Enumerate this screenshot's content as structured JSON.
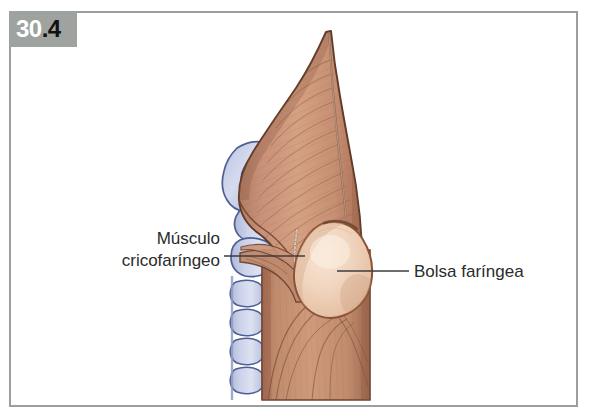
{
  "figure": {
    "number_major": "30",
    "number_minor": ".4",
    "full_number": "30.4",
    "caption_language": "es"
  },
  "frame": {
    "border_color": "#9a9e9c",
    "background_color": "#ffffff",
    "badge_background": "#9ea3a0",
    "badge_major_color": "#ffffff",
    "badge_minor_color": "#111111"
  },
  "annotations": [
    {
      "id": "cricopharyngeus",
      "line1": "Músculo",
      "line2": "cricofaríngeo",
      "text": "Músculo cricofaríngeo",
      "side": "left",
      "leader_from_x": 224,
      "leader_to_x": 305,
      "leader_y": 256
    },
    {
      "id": "pharyngeal-pouch",
      "line1": "Bolsa faríngea",
      "line2": "",
      "text": "Bolsa faríngea",
      "side": "right",
      "leader_from_x": 337,
      "leader_to_x": 409,
      "leader_y": 271
    }
  ],
  "illustration": {
    "title": "Bolsa faríngea (divertículo de Zenker) y músculo cricofaríngeo",
    "structures": [
      {
        "name": "constrictor-pharyngeus-muscle",
        "label": "Músculo constrictor de la faringe",
        "fill": "#c48d73",
        "stroke": "#6d4430"
      },
      {
        "name": "pharyngeal-pouch",
        "label": "Bolsa faríngea",
        "fill": "#edcbb2",
        "stroke": "#8a5335"
      },
      {
        "name": "cervical-vertebrae",
        "label": "Vértebras cervicales",
        "fill": "#c3cbe6",
        "stroke": "#4f5f93"
      },
      {
        "name": "oesophagus-muscle",
        "label": "Esófago",
        "fill": "#c18a6e",
        "stroke": "#7a4b33"
      },
      {
        "name": "median-raphe",
        "label": "Rafe medio",
        "stroke": "#8d6a52"
      },
      {
        "name": "cricopharyngeus-dotted-margin",
        "label": "Margen del músculo cricofaríngeo",
        "stroke": "#ffffff"
      }
    ],
    "colors": {
      "muscle_light": "#d6a083",
      "muscle_mid": "#c48d73",
      "muscle_dark": "#a86f55",
      "muscle_outline": "#5f3a27",
      "pouch_light": "#f3ddc9",
      "pouch_mid": "#edcbb2",
      "pouch_outline": "#8a5335",
      "bone_light": "#dfe4f2",
      "bone_mid": "#c3cbe6",
      "bone_outline": "#4f5f93",
      "leader_line": "#3c3c3c",
      "label_text": "#2b2b2b"
    }
  }
}
